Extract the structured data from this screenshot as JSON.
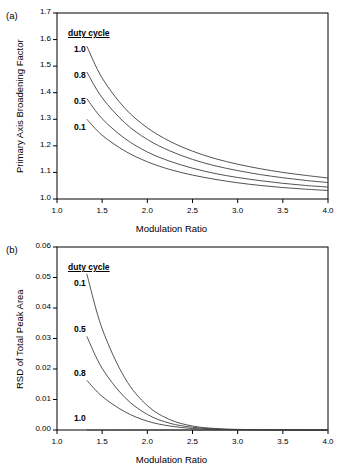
{
  "figure": {
    "panels": [
      {
        "id": "a",
        "label": "(a)",
        "legend_title": "duty cycle",
        "legend_order": [
          "1.0",
          "0.8",
          "0.5",
          "0.1"
        ]
      },
      {
        "id": "b",
        "label": "(b)",
        "legend_title": "duty cycle",
        "legend_order": [
          "0.1",
          "0.5",
          "0.8",
          "1.0"
        ]
      }
    ]
  },
  "chart_data": [
    {
      "type": "line",
      "panel": "a",
      "title": "",
      "xlabel": "Modulation Ratio",
      "ylabel": "Primary Axis Broadening Factor",
      "xlim": [
        1.0,
        4.0
      ],
      "ylim": [
        1.0,
        1.7
      ],
      "xticks": [
        "1.0",
        "1.5",
        "2.0",
        "2.5",
        "3.0",
        "3.5",
        "4.0"
      ],
      "yticks": [
        "1.0",
        "1.1",
        "1.2",
        "1.3",
        "1.4",
        "1.5",
        "1.6",
        "1.7"
      ],
      "grid": false,
      "legend_position": "upper-left-inside",
      "legend_title": "duty cycle",
      "x": [
        1.33,
        1.5,
        1.75,
        2.0,
        2.25,
        2.5,
        2.75,
        3.0,
        3.25,
        3.5,
        3.75,
        4.0
      ],
      "series": [
        {
          "name": "1.0",
          "values": [
            1.575,
            1.455,
            1.342,
            1.268,
            1.217,
            1.18,
            1.152,
            1.131,
            1.114,
            1.1,
            1.089,
            1.079
          ]
        },
        {
          "name": "0.8",
          "values": [
            1.478,
            1.381,
            1.287,
            1.224,
            1.181,
            1.149,
            1.125,
            1.107,
            1.092,
            1.08,
            1.07,
            1.062
          ]
        },
        {
          "name": "0.5",
          "values": [
            1.378,
            1.302,
            1.228,
            1.177,
            1.142,
            1.116,
            1.096,
            1.081,
            1.069,
            1.059,
            1.051,
            1.045
          ]
        },
        {
          "name": "0.1",
          "values": [
            1.3,
            1.24,
            1.181,
            1.14,
            1.111,
            1.09,
            1.074,
            1.061,
            1.051,
            1.043,
            1.037,
            1.032
          ]
        }
      ]
    },
    {
      "type": "line",
      "panel": "b",
      "title": "",
      "xlabel": "Modulation Ratio",
      "ylabel": "RSD of Total Peak Area",
      "xlim": [
        1.0,
        4.0
      ],
      "ylim": [
        0.0,
        0.06
      ],
      "xticks": [
        "1.0",
        "1.5",
        "2.0",
        "2.5",
        "3.0",
        "3.5",
        "4.0"
      ],
      "yticks": [
        "0.00",
        "0.01",
        "0.02",
        "0.03",
        "0.04",
        "0.05",
        "0.06"
      ],
      "grid": false,
      "legend_position": "upper-left-inside",
      "legend_title": "duty cycle",
      "x": [
        1.33,
        1.5,
        1.75,
        2.0,
        2.25,
        2.5,
        2.75,
        3.0,
        3.25,
        3.5,
        3.75,
        4.0
      ],
      "series": [
        {
          "name": "0.1",
          "values": [
            0.0512,
            0.0332,
            0.0171,
            0.008,
            0.0034,
            0.0013,
            0.0005,
            0.0002,
            0.0001,
            3e-05,
            1e-05,
            0.0
          ]
        },
        {
          "name": "0.5",
          "values": [
            0.0307,
            0.0202,
            0.0107,
            0.0051,
            0.0022,
            0.0009,
            0.0003,
            0.0001,
            5e-05,
            2e-05,
            1e-05,
            0.0
          ]
        },
        {
          "name": "0.8",
          "values": [
            0.0163,
            0.011,
            0.006,
            0.0029,
            0.0013,
            0.0005,
            0.0002,
            0.0001,
            3e-05,
            1e-05,
            0.0,
            0.0
          ]
        },
        {
          "name": "1.0",
          "values": [
            0.0,
            0.0,
            0.0,
            0.0,
            0.0,
            0.0,
            0.0,
            0.0,
            0.0,
            0.0,
            0.0,
            0.0
          ]
        }
      ]
    }
  ]
}
